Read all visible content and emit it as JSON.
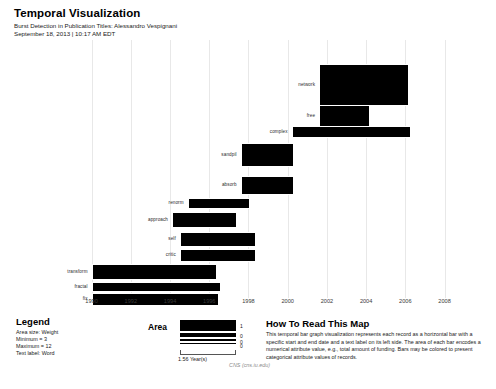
{
  "header": {
    "title": "Temporal Visualization",
    "subtitle": "Burst Detection in Publication Titles: Alessandro Vespignani",
    "timestamp": "September 18, 2013 | 10:17 AM EDT"
  },
  "legend": {
    "title": "Legend",
    "lines": [
      "Area size: Weight",
      "Minimum = 3",
      "Maximum = 12",
      "Text label: Word"
    ]
  },
  "area_legend": {
    "title": "Area",
    "swatches": [
      {
        "value": "1",
        "thickness": 11
      },
      {
        "value": "0",
        "thickness": 4
      },
      {
        "value": "0",
        "thickness": 2
      },
      {
        "value": "0",
        "thickness": 1
      }
    ],
    "scale_label": "1.56 Year(s)"
  },
  "how_to_read": {
    "title": "How To Read This Map",
    "body": "This temporal bar graph visualization represents each record as a horizontal bar with a specific start and end date and a text label on its left side. The area of each bar encodes a numerical attribute value, e.g., total amount of funding. Bars may be colored to present categorical attribute values of records."
  },
  "attribution": "CNS (cns.iu.edu)",
  "chart_data": {
    "type": "bar",
    "orientation": "horizontal",
    "title": "Temporal Visualization",
    "subtitle": "Burst Detection in Publication Titles: Alessandro Vespignani",
    "xlabel": "",
    "ylabel": "",
    "xlim": [
      1989.0,
      2009.4
    ],
    "grid": true,
    "bar_color": "#000000",
    "ticks": [
      {
        "label": "1990",
        "value": 1990
      },
      {
        "label": "1992",
        "value": 1992
      },
      {
        "label": "1994",
        "value": 1994
      },
      {
        "label": "1996",
        "value": 1996
      },
      {
        "label": "1998",
        "value": 1998
      },
      {
        "label": "2000",
        "value": 2000
      },
      {
        "label": "2002",
        "value": 2002
      },
      {
        "label": "2004",
        "value": 2004
      },
      {
        "label": "2006",
        "value": 2006
      },
      {
        "label": "2008",
        "value": 2008
      }
    ],
    "bars": [
      {
        "label": "network",
        "start": 2001.6,
        "end": 2006.1,
        "row_center": 84,
        "thickness": 40
      },
      {
        "label": "free",
        "start": 2001.6,
        "end": 2004.1,
        "row_center": 115,
        "thickness": 20
      },
      {
        "label": "complex",
        "start": 2000.2,
        "end": 2006.2,
        "row_center": 131,
        "thickness": 10
      },
      {
        "label": "sandpil",
        "start": 1997.6,
        "end": 2000.2,
        "row_center": 154,
        "thickness": 22
      },
      {
        "label": "absorb",
        "start": 1997.6,
        "end": 2000.2,
        "row_center": 184,
        "thickness": 17
      },
      {
        "label": "renorm",
        "start": 1994.9,
        "end": 1998.0,
        "row_center": 202,
        "thickness": 9
      },
      {
        "label": "approach",
        "start": 1994.1,
        "end": 1997.3,
        "row_center": 219,
        "thickness": 14
      },
      {
        "label": "self",
        "start": 1994.5,
        "end": 1998.3,
        "row_center": 238,
        "thickness": 13
      },
      {
        "label": "critic",
        "start": 1994.5,
        "end": 1998.3,
        "row_center": 254,
        "thickness": 11
      },
      {
        "label": "transform",
        "start": 1990.0,
        "end": 1996.3,
        "row_center": 271,
        "thickness": 14
      },
      {
        "label": "fractal",
        "start": 1990.0,
        "end": 1996.5,
        "row_center": 286,
        "thickness": 8
      },
      {
        "label": "fix",
        "start": 1990.0,
        "end": 1996.4,
        "row_center": 298,
        "thickness": 11
      }
    ]
  }
}
